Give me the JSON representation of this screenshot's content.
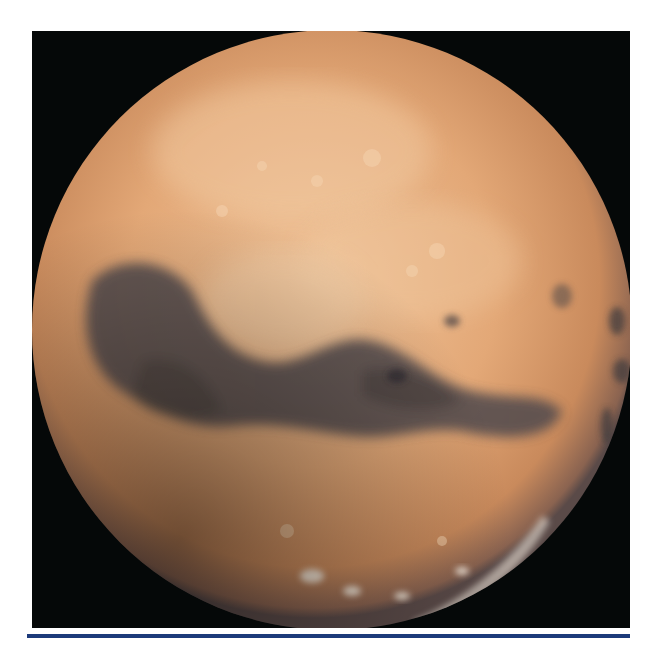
{
  "image": {
    "subject": "Mars",
    "alt": "Full-disk view of the planet Mars showing the Valles Marineris canyon system and dark albedo features",
    "background_color": "#050808",
    "planet_base_color": "#d99a68",
    "planet_highlight_color": "#f0c79c",
    "dark_region_color": "#4e4a4c",
    "polar_cap_color": "#f4ece0"
  },
  "rule": {
    "color": "#1c3a7a"
  }
}
